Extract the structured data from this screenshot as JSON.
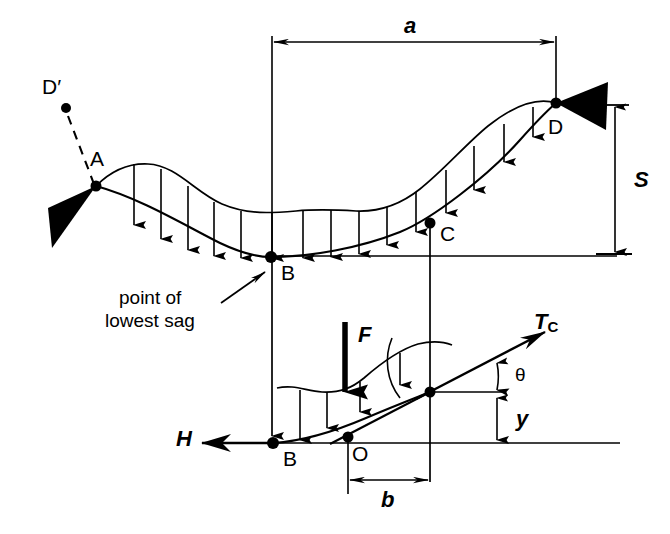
{
  "figure": {
    "type": "engineering-diagram",
    "background_color": "#ffffff",
    "line_color": "#000000"
  },
  "upper_diagram": {
    "points": [
      {
        "id": "A",
        "label": "A",
        "x": 96,
        "y": 186
      },
      {
        "id": "B",
        "label": "B",
        "x": 271,
        "y": 257
      },
      {
        "id": "C",
        "label": "C",
        "x": 430,
        "y": 223
      },
      {
        "id": "D",
        "label": "D",
        "x": 556,
        "y": 103
      },
      {
        "id": "Dp",
        "label": "D′",
        "x": 66,
        "y": 108
      }
    ],
    "dimensions": [
      {
        "id": "a",
        "label": "a",
        "orientation": "horizontal",
        "from_x": 272,
        "to_x": 556,
        "y": 42
      },
      {
        "id": "S",
        "label": "S",
        "orientation": "vertical",
        "x": 615,
        "from_y": 105,
        "to_y": 253
      }
    ],
    "annotation": {
      "id": "lowest-sag",
      "line1": "point of",
      "line2": "lowest sag"
    },
    "supports": [
      {
        "id": "support-A",
        "at": "A",
        "direction": "right"
      },
      {
        "id": "support-D",
        "at": "D",
        "direction": "left"
      }
    ],
    "load_arrow_count": 13
  },
  "lower_diagram": {
    "points": [
      {
        "id": "B2",
        "label": "B",
        "x": 273,
        "y": 443
      },
      {
        "id": "O",
        "label": "O",
        "x": 348,
        "y": 437
      },
      {
        "id": "Cp",
        "label": "",
        "x": 430,
        "y": 392
      }
    ],
    "forces": [
      {
        "id": "H",
        "label": "H",
        "direction": "left",
        "from_x": 268,
        "to_x": 200,
        "y": 443
      },
      {
        "id": "F",
        "label": "F",
        "direction": "down",
        "x": 345,
        "from_y": 322,
        "to_y": 392
      },
      {
        "id": "Tc",
        "label": "T",
        "subscript": "C",
        "direction": "up-right"
      }
    ],
    "dimensions": [
      {
        "id": "b",
        "label": "b",
        "orientation": "horizontal",
        "from_x": 348,
        "to_x": 430,
        "y": 480
      },
      {
        "id": "y",
        "label": "y",
        "orientation": "vertical",
        "x": 497,
        "from_y": 396,
        "to_y": 444
      }
    ],
    "angle": {
      "id": "theta",
      "label": "θ"
    },
    "load_arrow_count": 3
  }
}
